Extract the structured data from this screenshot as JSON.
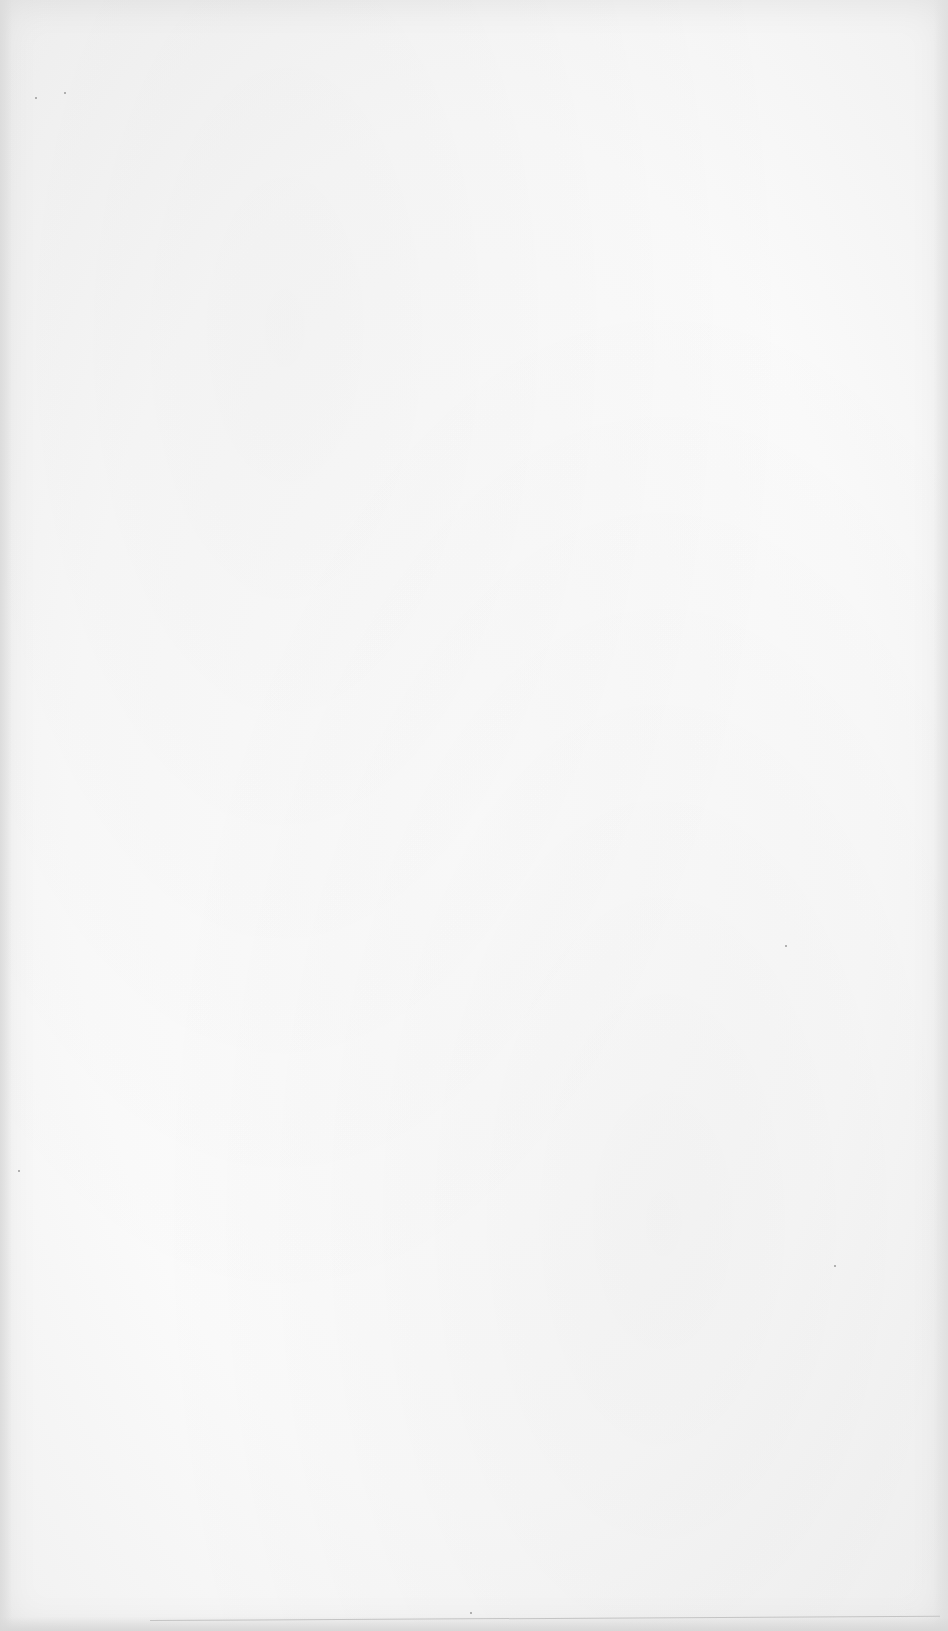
{
  "document": {
    "page_type": "blank scanned page",
    "text": "",
    "background_color": "#fafafa",
    "border_color": "#dcdcdc"
  }
}
